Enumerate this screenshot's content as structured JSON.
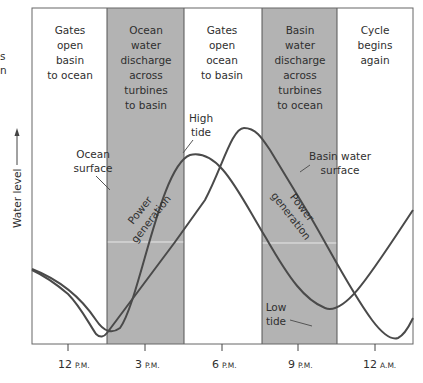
{
  "diagram": {
    "y_axis_label": "Water level",
    "cut_off_left_text": [
      "s",
      "n"
    ],
    "phases": [
      {
        "lines": [
          "Gates",
          "open",
          "basin",
          "to ocean"
        ],
        "shaded": false
      },
      {
        "lines": [
          "Ocean",
          "water",
          "discharge",
          "across",
          "turbines",
          "to basin"
        ],
        "shaded": true
      },
      {
        "lines": [
          "Gates",
          "open",
          "ocean",
          "to basin"
        ],
        "shaded": false
      },
      {
        "lines": [
          "Basin",
          "water",
          "discharge",
          "across",
          "turbines",
          "to ocean"
        ],
        "shaded": true
      },
      {
        "lines": [
          "Cycle",
          "begins",
          "again"
        ],
        "shaded": false
      }
    ],
    "curve_labels": {
      "ocean_surface": [
        "Ocean",
        "surface"
      ],
      "high_tide": [
        "High",
        "tide"
      ],
      "basin_water_surface": [
        "Basin water",
        "surface"
      ],
      "low_tide": [
        "Low",
        "tide"
      ],
      "power_generation_1": [
        "Power",
        "generation"
      ],
      "power_generation_2": [
        "Power",
        "generation"
      ]
    },
    "x_ticks": [
      {
        "num": "12",
        "suffix": "P.M."
      },
      {
        "num": "3",
        "suffix": "P.M."
      },
      {
        "num": "6",
        "suffix": "P.M."
      },
      {
        "num": "9",
        "suffix": "P.M."
      },
      {
        "num": "12",
        "suffix": "A.M."
      }
    ],
    "colors": {
      "shade": "#b3b3b3",
      "frame": "#555555",
      "curve": "#4a4a4a",
      "text": "#2f2f2f"
    }
  }
}
